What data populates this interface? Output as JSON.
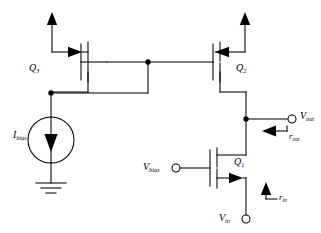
{
  "diagram": {
    "type": "schematic",
    "stroke_color": "#000000",
    "background_color": "#ffffff"
  },
  "labels": {
    "q3": {
      "base": "Q",
      "sub": "3"
    },
    "q2": {
      "base": "Q",
      "sub": "2"
    },
    "q1": {
      "base": "Q",
      "sub": "1"
    },
    "i_bias": {
      "base": "I",
      "sub": "bias"
    },
    "v_bias": {
      "base": "V",
      "sub": "bias"
    },
    "v_out": {
      "base": "V",
      "sub": "out"
    },
    "v_in": {
      "base": "V",
      "sub": "in"
    },
    "r_out": {
      "base": "r",
      "sub": "out"
    },
    "r_in": {
      "base": "r",
      "sub": "in"
    }
  },
  "nodes": {
    "gate_junction": "gate-bus-node",
    "mirror_junction": "mirror-input-node",
    "output_junction": "output-node"
  },
  "terminals": {
    "v_bias_terminal": "open-circle",
    "v_out_terminal": "open-circle",
    "v_in_terminal": "open-circle"
  },
  "symbols": {
    "current_source": "circle-with-down-arrow",
    "ground": "three-bar-ground",
    "supply_left": "up-arrow",
    "supply_right": "up-arrow",
    "current_arrow_q3": "right-arrow",
    "current_arrow_q2": "left-arrow",
    "current_arrow_q1": "right-arrow",
    "r_out_arrow": "left-arrow",
    "r_in_arrow": "up-arrow"
  }
}
